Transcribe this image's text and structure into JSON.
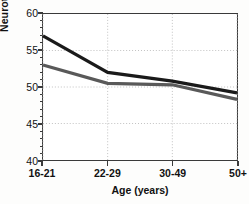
{
  "chart_data": {
    "type": "line",
    "title": "",
    "xlabel": "Age (years)",
    "ylabel": "Neuroticism score",
    "categories": [
      "16-21",
      "22-29",
      "30-49",
      "50+"
    ],
    "series": [
      {
        "name": "series-1",
        "color": "#1a1a1a",
        "values": [
          57.0,
          52.0,
          50.8,
          49.2
        ]
      },
      {
        "name": "series-2",
        "color": "#595959",
        "values": [
          53.0,
          50.5,
          50.3,
          48.3
        ]
      }
    ],
    "ylim": [
      40,
      60
    ],
    "ytick_labels": [
      "40",
      "45",
      "50",
      "55",
      "60"
    ],
    "ytick_values": [
      40,
      45,
      50,
      55,
      60
    ],
    "yminor_step": 1,
    "grid": "dotted-both",
    "grid_color": "#b9b9b9",
    "legend": "none",
    "axis_color": "#3a3a3a",
    "background": "#ffffff"
  },
  "axes": {
    "y_title": "Neuroticism score",
    "x_title": "Age (years)"
  }
}
